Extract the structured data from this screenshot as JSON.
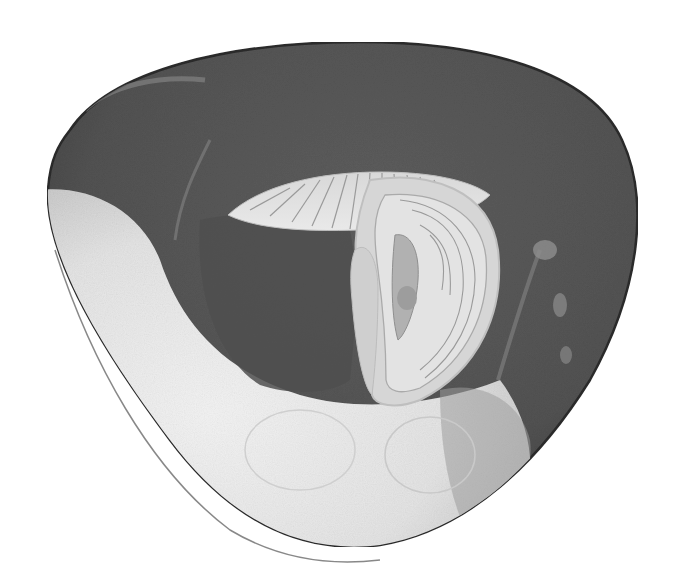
{
  "image": {
    "width": 677,
    "height": 587,
    "background": "#ffffff",
    "subject": "grayscale microscope cross-section of a rounded-triangular specimen"
  },
  "palette": {
    "outer_dark": "#4a4a4a",
    "body_dark": "#5a5a5a",
    "cavity_dark": "#555555",
    "rim_line": "#2b2b2b",
    "pale_crescent": "#e6e6e6",
    "pale_highlight": "#f4f4f4",
    "inner_band": "#cfcfcf",
    "inner_band_light": "#e2e2e2",
    "inner_core": "#a9a9a9",
    "striation": "#8c8c8c",
    "side_spots": "#8e8e8e"
  },
  "regions": [
    {
      "name": "outer-body",
      "description": "dark gray rounded-triangular mass"
    },
    {
      "name": "pale-crescent",
      "description": "light crescent along lower-left and bottom"
    },
    {
      "name": "fan-structure",
      "description": "pale striated fan across upper center"
    },
    {
      "name": "curved-organ",
      "description": "pale banded curved body on right-center"
    },
    {
      "name": "dark-cavity",
      "description": "dark interior region left of curved organ"
    },
    {
      "name": "side-spots",
      "description": "faint pale blotches near right margin"
    }
  ]
}
